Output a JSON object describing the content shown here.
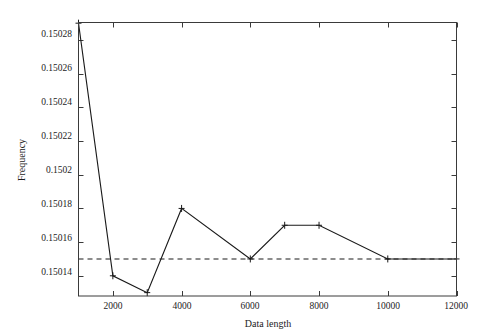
{
  "chart_data": {
    "type": "line",
    "title": "",
    "xlabel": "Data length",
    "ylabel": "Frequency",
    "xlim": [
      1000,
      12000
    ],
    "ylim": [
      0.150128,
      0.1502904
    ],
    "grid": false,
    "legend": null,
    "x": [
      1000,
      2000,
      3000,
      4000,
      6000,
      7000,
      8000,
      10000,
      12000
    ],
    "series": [
      {
        "name": "Frequency estimate",
        "marker": "plus",
        "linestyle": "solid",
        "values": [
          0.15029,
          0.15014,
          0.15013,
          0.15018,
          0.15015,
          0.15017,
          0.15017,
          0.15015,
          0.15015
        ]
      }
    ],
    "reference_line": {
      "name": "True frequency",
      "orientation": "horizontal",
      "value": 0.15015,
      "linestyle": "dashed"
    },
    "xticks": [
      2000,
      4000,
      6000,
      8000,
      10000,
      12000
    ],
    "xtick_labels": [
      "2000",
      "4000",
      "6000",
      "8000",
      "10000",
      "12000"
    ],
    "yticks": [
      0.15014,
      0.15016,
      0.15018,
      0.1502,
      0.15022,
      0.15024,
      0.15026,
      0.15028
    ],
    "ytick_labels": [
      "0.15014",
      "0.15016",
      "0.15018",
      "0.1502",
      "0.15022",
      "0.15024",
      "0.15026",
      "0.15028"
    ],
    "colors": {
      "line": "#1a1a1a",
      "reference": "#1a1a1a",
      "axis": "#3a3a3a",
      "background": "#ffffff"
    }
  }
}
